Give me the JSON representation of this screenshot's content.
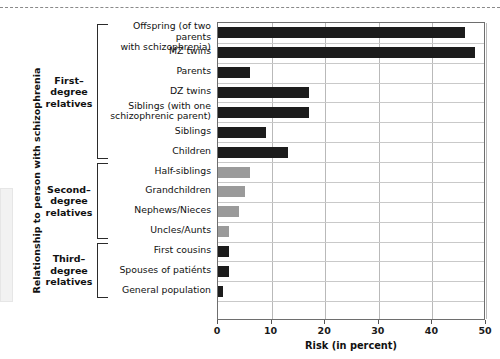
{
  "chart_data": {
    "type": "bar",
    "orientation": "horizontal",
    "title": "",
    "xlabel": "Risk (in percent)",
    "ylabel": "Relationship to person with schizophrenia",
    "xlim": [
      0,
      50
    ],
    "xticks": [
      0,
      10,
      20,
      30,
      40,
      50
    ],
    "grid": true,
    "legend": "none",
    "categories": [
      "Offspring (of two parents with schizophrenia)",
      "MZ twins",
      "Parents",
      "DZ twins",
      "Siblings (with one schizophrenic parent)",
      "Siblings",
      "Children",
      "Half-siblings",
      "Grandchildren",
      "Nephews/Nieces",
      "Uncles/Aunts",
      "First cousins",
      "Spouses  of patiénts",
      "General population"
    ],
    "values": [
      46,
      48,
      6,
      17,
      17,
      9,
      13,
      6,
      5,
      4,
      2,
      2,
      2,
      1
    ],
    "bar_colors": [
      "#1c1c1c",
      "#1c1c1c",
      "#1c1c1c",
      "#1c1c1c",
      "#1c1c1c",
      "#1c1c1c",
      "#1c1c1c",
      "#9a9a9a",
      "#9a9a9a",
      "#9a9a9a",
      "#9a9a9a",
      "#1c1c1c",
      "#1c1c1c",
      "#1c1c1c"
    ],
    "rows": [
      {
        "label": "Offspring (of two parents\nwith schizophrenia)",
        "label_line1": "Offspring (of two parents",
        "label_line2": "with schizophrenia)",
        "value": 46,
        "color": "#1c1c1c",
        "group": "first"
      },
      {
        "label": "MZ twins",
        "label_line1": "MZ twins",
        "label_line2": "",
        "value": 48,
        "color": "#1c1c1c",
        "group": "first"
      },
      {
        "label": "Parents",
        "label_line1": "Parents",
        "label_line2": "",
        "value": 6,
        "color": "#1c1c1c",
        "group": "first"
      },
      {
        "label": "DZ twins",
        "label_line1": "DZ twins",
        "label_line2": "",
        "value": 17,
        "color": "#1c1c1c",
        "group": "first"
      },
      {
        "label": "Siblings (with one schizophrenic parent)",
        "label_line1": "Siblings (with one",
        "label_line2": "schizophrenic parent)",
        "value": 17,
        "color": "#1c1c1c",
        "group": "first"
      },
      {
        "label": "Siblings",
        "label_line1": "Siblings",
        "label_line2": "",
        "value": 9,
        "color": "#1c1c1c",
        "group": "first"
      },
      {
        "label": "Children",
        "label_line1": "Children",
        "label_line2": "",
        "value": 13,
        "color": "#1c1c1c",
        "group": "first"
      },
      {
        "label": "Half-siblings",
        "label_line1": "Half-siblings",
        "label_line2": "",
        "value": 6,
        "color": "#9a9a9a",
        "group": "second"
      },
      {
        "label": "Grandchildren",
        "label_line1": "Grandchildren",
        "label_line2": "",
        "value": 5,
        "color": "#9a9a9a",
        "group": "second"
      },
      {
        "label": "Nephews/Nieces",
        "label_line1": "Nephews/Nieces",
        "label_line2": "",
        "value": 4,
        "color": "#9a9a9a",
        "group": "second"
      },
      {
        "label": "Uncles/Aunts",
        "label_line1": "Uncles/Aunts",
        "label_line2": "",
        "value": 2,
        "color": "#9a9a9a",
        "group": "second"
      },
      {
        "label": "First cousins",
        "label_line1": "First cousins",
        "label_line2": "",
        "value": 2,
        "color": "#1c1c1c",
        "group": "third"
      },
      {
        "label": "Spouses  of patiénts",
        "label_line1": "Spouses  of patiénts",
        "label_line2": "",
        "value": 2,
        "color": "#1c1c1c",
        "group": "third"
      },
      {
        "label": "General population",
        "label_line1": "General population",
        "label_line2": "",
        "value": 1,
        "color": "#1c1c1c",
        "group": "third"
      }
    ]
  },
  "groups": [
    {
      "id": "first",
      "line1": "First–",
      "line2": "degree",
      "line3": "relatives"
    },
    {
      "id": "second",
      "line1": "Second–",
      "line2": "degree",
      "line3": "relatives"
    },
    {
      "id": "third",
      "line1": "Third–",
      "line2": "degree",
      "line3": "relatives"
    }
  ],
  "axes": {
    "y_title": "Relationship to person with schizophrenia",
    "x_title": "Risk (in percent)",
    "x_tick_labels": [
      "0",
      "10",
      "20",
      "30",
      "40",
      "50"
    ]
  },
  "colors": {
    "bar_dark": "#1c1c1c",
    "bar_gray": "#9a9a9a",
    "grid": "#b9b9b9",
    "plot_border": "#6e6e6e",
    "text": "#111111"
  }
}
